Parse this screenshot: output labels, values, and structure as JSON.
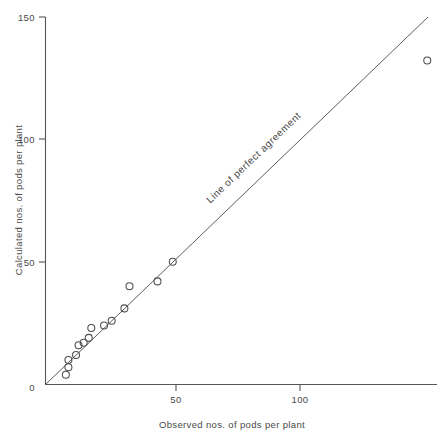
{
  "chart_data": {
    "type": "scatter",
    "title": "",
    "xlabel": "Observed nos. of pods per plant",
    "ylabel": "Calculated nos. of pods per plant",
    "xlim": [
      0,
      155
    ],
    "ylim": [
      0,
      150
    ],
    "xticks": [
      0,
      50,
      100
    ],
    "xticklabels": [
      "0",
      "50",
      "100"
    ],
    "yticks": [
      0,
      50,
      100,
      150
    ],
    "yticklabels": [
      "0",
      "50",
      "100",
      "150"
    ],
    "grid": false,
    "legend": null,
    "marker": "open-circle",
    "annotations": [
      {
        "text": "Line of perfect agreement",
        "x": 52,
        "y": 62,
        "rotation": -44
      }
    ],
    "reference_line": {
      "name": "line-of-perfect-agreement",
      "type": "identity",
      "x": [
        0,
        150
      ],
      "y": [
        0,
        150
      ]
    },
    "points": [
      {
        "x": 8,
        "y": 4
      },
      {
        "x": 9,
        "y": 7
      },
      {
        "x": 9,
        "y": 10
      },
      {
        "x": 12,
        "y": 12
      },
      {
        "x": 13,
        "y": 16
      },
      {
        "x": 15,
        "y": 17
      },
      {
        "x": 17,
        "y": 19
      },
      {
        "x": 18,
        "y": 23
      },
      {
        "x": 23,
        "y": 24
      },
      {
        "x": 26,
        "y": 26
      },
      {
        "x": 31,
        "y": 31
      },
      {
        "x": 33,
        "y": 40
      },
      {
        "x": 44,
        "y": 42
      },
      {
        "x": 50,
        "y": 50
      },
      {
        "x": 150,
        "y": 132
      }
    ]
  },
  "axis": {
    "x_title": "Observed nos. of pods per plant",
    "y_title": "Calculated nos. of pods per plant",
    "x_tick_0": "0",
    "x_tick_50": "50",
    "x_tick_100": "100",
    "y_tick_0": "0",
    "y_tick_50": "50",
    "y_tick_100": "100",
    "y_tick_150": "150"
  },
  "annotation": {
    "line_label": "Line of perfect agreement"
  },
  "colors": {
    "axis": "#555555",
    "marker": "#4d4d4d",
    "reference_line": "#4a4a4a",
    "text": "#4a4a4a",
    "background": "#ffffff"
  }
}
